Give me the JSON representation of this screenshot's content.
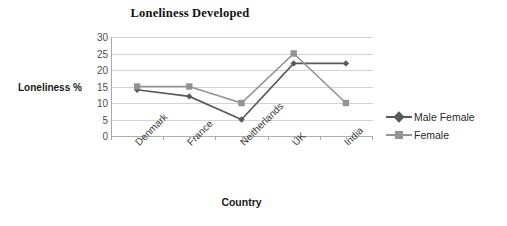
{
  "chart_data": {
    "type": "line",
    "title": "Loneliness Developed",
    "xlabel": "Country",
    "ylabel": "Loneliness %",
    "categories": [
      "Denmark",
      "France",
      "Neitherlands",
      "UK",
      "India"
    ],
    "series": [
      {
        "name": "Male Female",
        "values": [
          14,
          12,
          5,
          22,
          22
        ],
        "color": "#595959",
        "marker": "diamond"
      },
      {
        "name": "Female",
        "values": [
          15,
          15,
          10,
          25,
          10
        ],
        "color": "#939393",
        "marker": "square"
      }
    ],
    "ylim": [
      0,
      30
    ],
    "yticks": [
      0,
      5,
      10,
      15,
      20,
      25,
      30
    ],
    "ytick_labels": [
      "0",
      "5",
      "10",
      "15",
      "20",
      "25",
      "30"
    ],
    "grid": true,
    "legend_position": "right"
  },
  "legend": {
    "entries": [
      {
        "label": "Male Female"
      },
      {
        "label": "Female"
      }
    ]
  }
}
